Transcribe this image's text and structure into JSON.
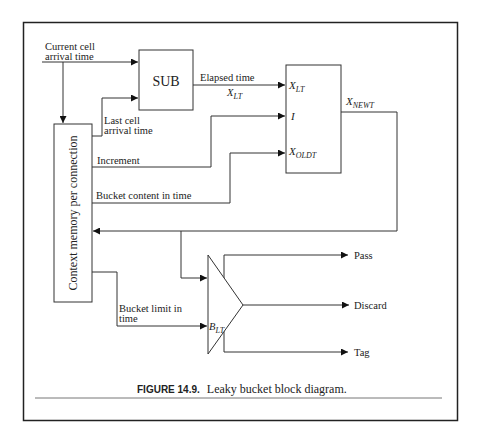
{
  "figure": {
    "number_label": "FIGURE 14.9.",
    "caption": "Leaky bucket block diagram."
  },
  "blocks": {
    "sub": {
      "label": "SUB"
    },
    "context_memory": {
      "label": "Context memory per connection"
    },
    "calc_block": {
      "inputs": [
        {
          "base": "X",
          "sub": "LT"
        },
        {
          "base": "I",
          "sub": ""
        },
        {
          "base": "X",
          "sub": "OLDT"
        }
      ],
      "output": {
        "base": "X",
        "sub": "NEWT"
      }
    },
    "comparator": {
      "input_label": {
        "base": "B",
        "sub": "LT"
      },
      "outputs": [
        "Pass",
        "Discard",
        "Tag"
      ]
    }
  },
  "signals": {
    "current_cell_line1": "Current cell",
    "current_cell_line2": "arrival time",
    "last_cell_line1": "Last cell",
    "last_cell_line2": "arrival time",
    "elapsed_time": "Elapsed time",
    "elapsed_symbol": {
      "base": "X",
      "sub": "LT"
    },
    "increment": "Increment",
    "bucket_content": "Bucket content in time",
    "bucket_limit_line1": "Bucket limit in",
    "bucket_limit_line2": "time"
  },
  "colors": {
    "line": "#333333",
    "frame": "#222222",
    "text": "#222222"
  }
}
